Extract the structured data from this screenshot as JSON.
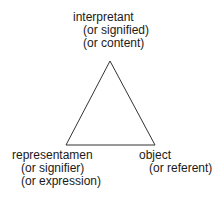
{
  "diagram": {
    "vertices": {
      "top": {
        "name": "interpretant",
        "alternates": [
          "(or signified)",
          "(or content)"
        ]
      },
      "bottom_left": {
        "name": "representamen",
        "alternates": [
          "(or signifier)",
          "(or expression)"
        ]
      },
      "bottom_right": {
        "name": "object",
        "alternates": [
          "(or referent)"
        ]
      }
    },
    "line_color": "#333333"
  }
}
